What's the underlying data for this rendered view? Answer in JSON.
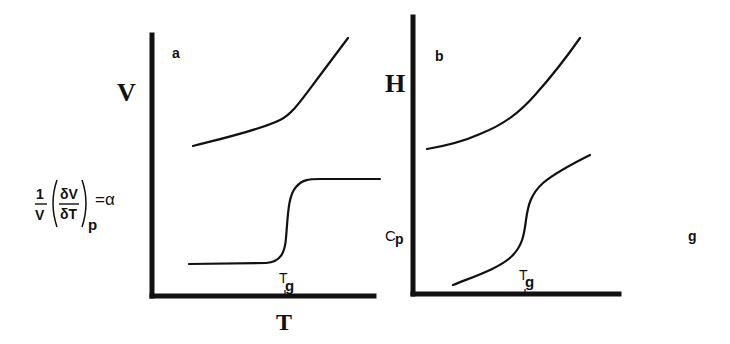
{
  "figure": {
    "ink_color": "#111111",
    "background_color": "#ffffff"
  },
  "panel_a": {
    "panel_label": "a",
    "upper_y_label": "V",
    "lower_y_label": {
      "fraction_num": "1",
      "fraction_den": "V",
      "inner_num": "δV",
      "inner_den": "δT",
      "subscript": "p",
      "equals": "=α"
    },
    "x_label": "T",
    "tick_label_main": "T",
    "tick_label_sub": "g",
    "upper_curve": {
      "name": "V vs T",
      "shape": "linear at low T, kinked at Tg, steeper above Tg"
    },
    "lower_curve": {
      "name": "alpha vs T",
      "shape": "low plateau, sharp step at Tg, high plateau"
    }
  },
  "panel_b": {
    "panel_label": "b",
    "upper_y_label": "H",
    "lower_y_label_main": "C",
    "lower_y_label_sub": "p",
    "tick_label_main": "T",
    "tick_label_sub": "g",
    "upper_curve": {
      "name": "H vs T",
      "shape": "smoothly increasing, concave up"
    },
    "lower_curve": {
      "name": "Cp vs T",
      "shape": "rising, sigmoidal step at Tg, continues rising"
    }
  },
  "stray_label": "g"
}
